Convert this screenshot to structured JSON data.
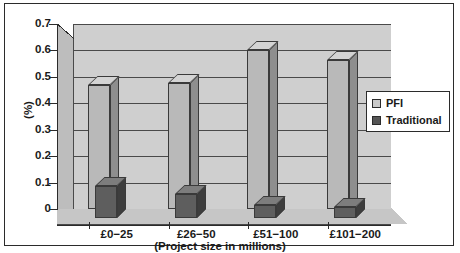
{
  "chart_data": {
    "type": "bar",
    "title": "",
    "xlabel": "(Project size in millions)",
    "ylabel": "(%)",
    "categories": [
      "£0−25",
      "£26−50",
      "£51−100",
      "£101−200"
    ],
    "series": [
      {
        "name": "PFI",
        "values": [
          0.47,
          0.475,
          0.6,
          0.565
        ],
        "color": "#b9b9b9"
      },
      {
        "name": "Traditional",
        "values": [
          0.12,
          0.09,
          0.05,
          0.04
        ],
        "color": "#5e5e5e"
      }
    ],
    "ylim": [
      0,
      0.7
    ],
    "yticks": [
      "0.7",
      "0.6",
      "0.5",
      "0.4",
      "0.3",
      "0.2",
      "0.1",
      "0"
    ],
    "ytick_values": [
      0.7,
      0.6,
      0.5,
      0.4,
      0.3,
      0.2,
      0.1,
      0
    ],
    "grid": true,
    "legend_position": "right-middle",
    "style": "3d-grouped-bar-grayscale"
  },
  "legend": {
    "items": [
      {
        "label": "PFI",
        "swatch": "light-gray-swatch"
      },
      {
        "label": "Traditional",
        "swatch": "dark-gray-swatch"
      }
    ]
  },
  "colors": {
    "plot_background": "#cfcfcf",
    "frame_border": "#2b2b2b",
    "pfi": "#b9b9b9",
    "traditional": "#5e5e5e",
    "text": "#1a1a1a"
  }
}
